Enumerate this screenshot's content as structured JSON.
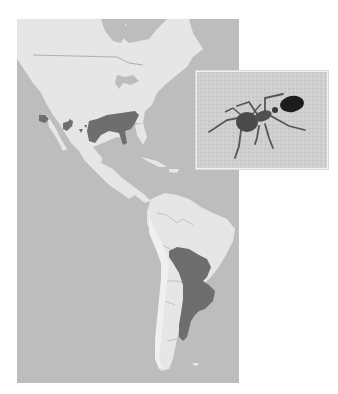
{
  "figure": {
    "type": "range-map",
    "region": "Americas",
    "caption_visible": false
  },
  "map": {
    "colors": {
      "ocean": "#bdbdbd",
      "land": "#e6e6e6",
      "land_highlight": "#efefef",
      "range": "#6e6e6e",
      "borders": "#8a8a8a"
    },
    "ranges": [
      {
        "id": "range-north-america",
        "label": "Introduced range (southeastern United States)"
      },
      {
        "id": "range-southwest-patches",
        "label": "Isolated patches (southwestern United States)"
      },
      {
        "id": "range-south-america",
        "label": "Native range (central South America)"
      }
    ]
  },
  "inset": {
    "subject": "ant photograph",
    "colors": {
      "background": "#cfcfcf",
      "ant_body": "#4a4a4a",
      "ant_gaster": "#1c1c1c"
    }
  },
  "sr": {
    "map_label": "Map of North and South America showing shaded species range",
    "inset_label": "Photo inset of an ant"
  }
}
